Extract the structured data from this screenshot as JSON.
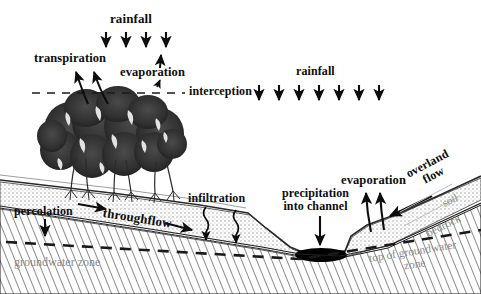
{
  "diagram": {
    "colors": {
      "ink": "#0d0d0d",
      "gray_text": "#8a8a8a",
      "soil_stipple": "#b9b9b9",
      "water": "#000000",
      "background": "#ffffff"
    }
  },
  "labels": {
    "rainfall_left": "rainfall",
    "rainfall_right": "rainfall",
    "transpiration": "transpiration",
    "evaporation_trees": "evaporation",
    "interception": "interception",
    "infiltration": "infiltration",
    "percolation": "percolation",
    "throughflow": "throughflow",
    "precipitation_into_channel_line1": "precipitation",
    "precipitation_into_channel_line2": "into channel",
    "evaporation_channel": "evaporation",
    "overland_line1": "overland",
    "overland_line2": "flow",
    "soil": "soil",
    "bedrock": "bedrock",
    "groundwater_zone": "groundwater zone",
    "top_of_groundwater_line1": "top of groundwater",
    "top_of_groundwater_line2": "zone"
  },
  "arrows": {
    "rainfall_left_count": 4,
    "rainfall_right_count": 7,
    "transpiration_count": 2,
    "evaporation_trees_count": 1,
    "infiltration_count": 2,
    "percolation_count": 1,
    "throughflow_count": 2,
    "precipitation_into_channel_count": 1,
    "evaporation_channel_count": 2,
    "overland_flow_count": 1
  },
  "layers": [
    {
      "name": "soil",
      "label": "soil"
    },
    {
      "name": "bedrock",
      "label": "bedrock"
    },
    {
      "name": "groundwater-zone",
      "label": "groundwater zone"
    }
  ]
}
